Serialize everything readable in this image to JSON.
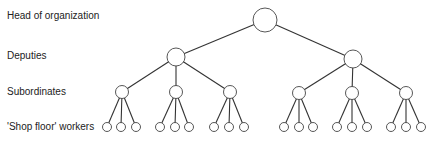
{
  "levels": [
    {
      "label": "Head of organization",
      "y": 16
    },
    {
      "label": "Deputies",
      "y": 56
    },
    {
      "label": "Subordinates",
      "y": 92
    },
    {
      "label": "'Shop floor' workers",
      "y": 127
    }
  ],
  "tree": {
    "head": {
      "x": 265,
      "y": 20,
      "r": 12
    },
    "deputies": [
      {
        "x": 176,
        "y": 57,
        "r": 9,
        "subs": [
          {
            "x": 122,
            "y": 92,
            "leaves": [
              107,
              121,
              136
            ]
          },
          {
            "x": 176,
            "y": 92,
            "leaves": [
              160,
              175,
              189
            ]
          },
          {
            "x": 230,
            "y": 92,
            "leaves": [
              214,
              229,
              244
            ]
          }
        ]
      },
      {
        "x": 353,
        "y": 59,
        "r": 9,
        "subs": [
          {
            "x": 299,
            "y": 93,
            "leaves": [
              284,
              299,
              313
            ]
          },
          {
            "x": 352,
            "y": 93,
            "leaves": [
              337,
              352,
              367
            ]
          },
          {
            "x": 406,
            "y": 93,
            "leaves": [
              391,
              406,
              421
            ]
          }
        ]
      }
    ],
    "sub_r": 6.5,
    "leaf_y": 127,
    "leaf_r": 4.5
  }
}
